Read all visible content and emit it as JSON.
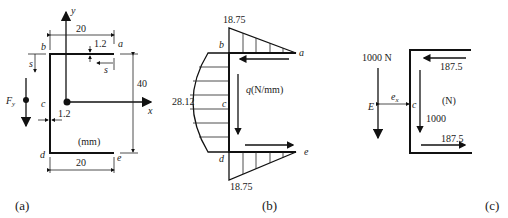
{
  "panel_a": {
    "caption": "(a)",
    "axis_y": "y",
    "axis_x": "x",
    "dim_top": "20",
    "dim_bottom": "20",
    "dim_height": "40",
    "thickness_top": "1.2",
    "thickness_web": "1.2",
    "point_a": "a",
    "point_b": "b",
    "point_c": "c",
    "point_d": "d",
    "point_e": "e",
    "s_label_top": "s",
    "s_label_left": "s",
    "force_label": "F",
    "force_sub": "y",
    "units": "(mm)"
  },
  "panel_b": {
    "caption": "(b)",
    "top_value": "18.75",
    "bottom_value": "18.75",
    "web_value": "28.12",
    "q_label": "q",
    "q_units": "(N/mm)",
    "point_a": "a",
    "point_b": "b",
    "point_c": "c",
    "point_d": "d",
    "point_e": "e"
  },
  "panel_c": {
    "caption": "(c)",
    "force_label": "1000 N",
    "point_E": "E",
    "point_c": "c",
    "ex_label": "e",
    "ex_sub": "x",
    "top_flange_force": "187.5",
    "bottom_flange_force": "187.5",
    "web_force": "1000",
    "units": "(N)"
  }
}
